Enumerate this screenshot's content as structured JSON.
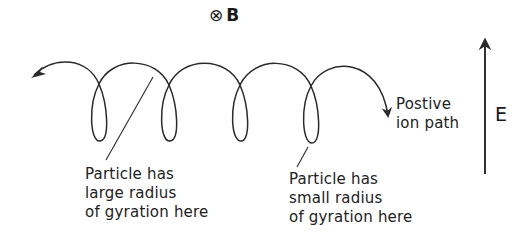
{
  "diagram": {
    "field_b": {
      "symbol": "⊗",
      "label": "B"
    },
    "field_e": {
      "label": "E",
      "direction": "up"
    },
    "path_label": {
      "lines": [
        "Postive",
        "ion path"
      ]
    },
    "annotations": [
      {
        "lines": [
          "Particle has",
          "large radius",
          "of gyration here"
        ]
      },
      {
        "lines": [
          "Particle has",
          "small radius",
          "of gyration here"
        ]
      }
    ],
    "colors": {
      "stroke": "#2a2a2a",
      "background": "#ffffff",
      "text": "#222222"
    }
  }
}
